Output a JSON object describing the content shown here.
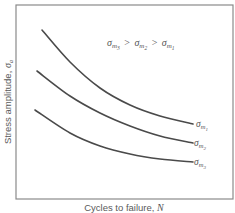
{
  "chart_data": {
    "type": "line",
    "title": "",
    "xlabel": "Cycles to failure, N",
    "ylabel": "Stress amplitude, σa",
    "axes": {
      "ticks": "none",
      "grid": false
    },
    "annotation": "σm3 > σm2 > σm1",
    "series": [
      {
        "name": "σm1",
        "label_main": "σ",
        "label_sub": "m",
        "label_subsub": "1",
        "points": [
          [
            42,
            30
          ],
          [
            70,
            62
          ],
          [
            100,
            88
          ],
          [
            130,
            105
          ],
          [
            160,
            116
          ],
          [
            193,
            124
          ]
        ]
      },
      {
        "name": "σm2",
        "label_main": "σ",
        "label_sub": "m",
        "label_subsub": "2",
        "points": [
          [
            37,
            71
          ],
          [
            70,
            96
          ],
          [
            100,
            113
          ],
          [
            130,
            126
          ],
          [
            160,
            136
          ],
          [
            193,
            143
          ]
        ]
      },
      {
        "name": "σm3",
        "label_main": "σ",
        "label_sub": "m",
        "label_subsub": "3",
        "points": [
          [
            35,
            110
          ],
          [
            70,
            133
          ],
          [
            100,
            146
          ],
          [
            130,
            154
          ],
          [
            160,
            159
          ],
          [
            193,
            162
          ]
        ]
      }
    ],
    "legend_position": "inline-right"
  },
  "labels": {
    "x_axis_text": "Cycles to failure, ",
    "x_axis_var": "N",
    "y_axis_text": "Stress amplitude, ",
    "y_axis_var": "σ",
    "y_axis_sub": "a",
    "annotation_parts": [
      {
        "main": "σ",
        "sub": "m",
        "subsub": "3"
      },
      {
        "op": ">"
      },
      {
        "main": "σ",
        "sub": "m",
        "subsub": "2"
      },
      {
        "op": ">"
      },
      {
        "main": "σ",
        "sub": "m",
        "subsub": "1"
      }
    ]
  },
  "colors": {
    "curve": "#4a4a4a",
    "frame": "#8a8a8a",
    "text": "#555555"
  }
}
